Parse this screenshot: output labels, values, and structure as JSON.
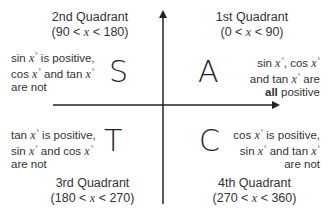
{
  "axes": {
    "color": "#222222",
    "vertical": {
      "x": 163,
      "y_top": 8,
      "y_bottom": 204,
      "arrow": "up"
    },
    "horizontal": {
      "y": 105,
      "x_left": 53,
      "x_right": 282,
      "arrow": "right"
    }
  },
  "quadrants": [
    {
      "id": "q2",
      "title": "2nd  Quadrant",
      "range": "(90 < x < 180)",
      "range_parts": [
        "(90 < ",
        "x",
        " < 180)"
      ],
      "letter": "S",
      "description_lines": [
        "sin x° is positive,",
        "cos x° and tan x°",
        "are not"
      ],
      "desc": {
        "l1a": "sin ",
        "l1x": "x",
        "l1b": " is positive,",
        "l2a": "cos ",
        "l2x": "x",
        "l2b": " and tan ",
        "l2x2": "x",
        "l3": "are not"
      }
    },
    {
      "id": "q1",
      "title": "1st  Quadrant",
      "range": "(0 < x < 90)",
      "range_parts": [
        "(0 < ",
        "x",
        " < 90)"
      ],
      "letter": "A",
      "description_lines": [
        "sin x°, cos x°",
        "and tan x° are",
        "all positive"
      ],
      "desc": {
        "l1a": "sin ",
        "l1x": "x",
        "l1b": ", cos ",
        "l1x2": "x",
        "l2a": "and tan ",
        "l2x": "x",
        "l2b": " are",
        "l3bold": "all",
        "l3b": " positive"
      }
    },
    {
      "id": "q3",
      "title": "3rd  Quadrant",
      "range": "(180 < x < 270)",
      "range_parts": [
        "(180 < ",
        "x",
        " < 270)"
      ],
      "letter": "T",
      "description_lines": [
        "tan x° is positive,",
        "sin x° and cos x°",
        "are not"
      ],
      "desc": {
        "l1a": "tan ",
        "l1x": "x",
        "l1b": " is positive,",
        "l2a": "sin ",
        "l2x": "x",
        "l2b": " and cos ",
        "l2x2": "x",
        "l3": "are not"
      }
    },
    {
      "id": "q4",
      "title": "4th  Quadrant",
      "range": "(270 < x < 360)",
      "range_parts": [
        "(270 < ",
        "x",
        " < 360)"
      ],
      "letter": "C",
      "description_lines": [
        "cos x° is positive,",
        "sin x° and tan x°",
        "are not"
      ],
      "desc": {
        "l1a": "cos ",
        "l1x": "x",
        "l1b": " is positive,",
        "l2a": "sin ",
        "l2x": "x",
        "l2b": " and tan ",
        "l2x2": "x",
        "l3": "are not"
      }
    }
  ],
  "degree_mark": "°"
}
